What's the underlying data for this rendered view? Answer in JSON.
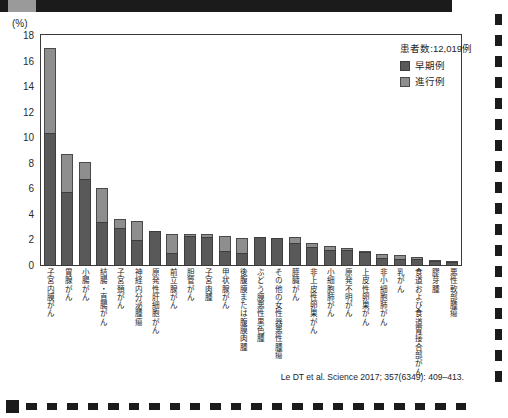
{
  "axis": {
    "unit_label": "(%)",
    "y_ticks": [
      0,
      2,
      4,
      6,
      8,
      10,
      12,
      14,
      16,
      18
    ]
  },
  "legend": {
    "patient_count_label": "患者数:12,019例",
    "early_label": "早期例",
    "advanced_label": "進行例",
    "early_color": "#595959",
    "advanced_color": "#8e8e8e"
  },
  "citation": "Le DT et al. Science 2017; 357(6349): 409–413.",
  "chart_data": {
    "type": "bar",
    "title": "",
    "xlabel": "",
    "ylabel": "(%)",
    "ylim": [
      0,
      18
    ],
    "grid": false,
    "stacked": true,
    "legend_position": "top-right",
    "annotations": [
      "患者数:12,019例"
    ],
    "categories": [
      "子宮内膜がん",
      "胃腺がん",
      "小腸がん",
      "結腸・直腸がん",
      "子宮頚がん",
      "神経内分泌腫瘍",
      "原発性肝細胞がん",
      "前立腺がん",
      "胆管がん",
      "子宮肉腫",
      "甲状腺がん",
      "後腹膜または腹膜肉腫",
      "ぶどう膜悪性黒色腫",
      "その他の女性器悪性腫瘍",
      "膵臓がん",
      "非上皮性卵巣がん",
      "小細胞肺がん",
      "原発不明がん",
      "上皮性卵巣がん",
      "非小細胞肺がん",
      "乳がん",
      "食道および食道胃接合部がん",
      "膠芽腫",
      "悪性軟部腫瘍"
    ],
    "series": [
      {
        "name": "早期例",
        "color": "#595959",
        "values": [
          10.3,
          5.7,
          6.7,
          3.4,
          2.9,
          1.95,
          2.7,
          0.95,
          2.25,
          2.2,
          1.1,
          0.95,
          2.2,
          2.1,
          1.7,
          1.4,
          1.2,
          1.2,
          1.0,
          0.55,
          0.5,
          0.5,
          0.3,
          0.2
        ]
      },
      {
        "name": "進行例",
        "color": "#8e8e8e",
        "values": [
          6.7,
          3.0,
          1.4,
          2.6,
          0.7,
          1.5,
          0.0,
          1.5,
          0.2,
          0.25,
          1.2,
          1.2,
          0.0,
          0.0,
          0.5,
          0.3,
          0.3,
          0.1,
          0.1,
          0.35,
          0.25,
          0.15,
          0.1,
          0.1
        ]
      }
    ],
    "totals": [
      17.0,
      8.7,
      8.1,
      6.0,
      3.6,
      3.45,
      2.7,
      2.45,
      2.45,
      2.45,
      2.3,
      2.15,
      2.2,
      2.1,
      2.2,
      1.7,
      1.5,
      1.3,
      1.1,
      0.9,
      0.75,
      0.65,
      0.4,
      0.3
    ]
  }
}
